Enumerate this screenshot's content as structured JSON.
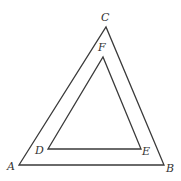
{
  "diagram": {
    "outer_triangle": {
      "vertices": [
        "A",
        "B",
        "C"
      ]
    },
    "inner_triangle": {
      "vertices": [
        "D",
        "E",
        "F"
      ]
    },
    "labels": {
      "A": "A",
      "B": "B",
      "C": "C",
      "D": "D",
      "E": "E",
      "F": "F"
    },
    "colors": {
      "stroke": "#3a3a3a",
      "label": "#333333",
      "background": "#ffffff"
    }
  }
}
